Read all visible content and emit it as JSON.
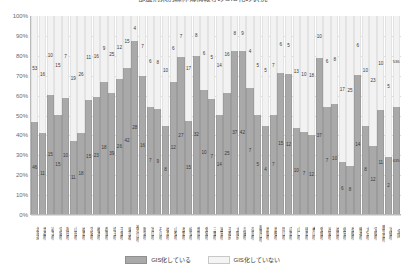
{
  "chart": {
    "title": "都道府県別森林簿情報等のGIS化の状況",
    "legend": {
      "position": "bottom",
      "items": [
        {
          "key": "yes",
          "label": "GIS化している",
          "color": "#a9a9a9"
        },
        {
          "key": "no",
          "label": "GIS化していない",
          "color": "#f4f4f4"
        }
      ]
    },
    "yticks": [
      "100%",
      "90%",
      "80%",
      "70%",
      "60%",
      "50%",
      "40%",
      "30%",
      "20%",
      "10%",
      "0%"
    ]
  },
  "chart_data": {
    "type": "bar",
    "stacked": true,
    "normalized": true,
    "title": "都道府県別森林簿情報等のGIS化の状況",
    "xlabel": "",
    "ylabel": "",
    "ylim": [
      0,
      100
    ],
    "grid": true,
    "legend_position": "bottom",
    "categories": [
      "北海道",
      "青森県",
      "岩手県",
      "宮城県",
      "秋田県",
      "山形県",
      "福島県",
      "茨城県",
      "栃木県",
      "群馬県",
      "埼玉県",
      "千葉県",
      "東京都",
      "神奈川県",
      "新潟県",
      "富山県",
      "石川県",
      "福井県",
      "山梨県",
      "長野県",
      "岐阜県",
      "静岡県",
      "愛知県",
      "三重県",
      "滋賀県",
      "京都府",
      "大阪府",
      "兵庫県",
      "奈良県",
      "和歌山県",
      "鳥取県",
      "島根県",
      "岡山県",
      "広島県",
      "山口県",
      "徳島県",
      "香川県",
      "愛媛県",
      "高知県",
      "福岡県",
      "佐賀県",
      "長崎県",
      "熊本県",
      "大分県",
      "宮崎県",
      "鹿児島県",
      "沖縄県",
      "全国"
    ],
    "series": [
      {
        "name": "GIS化している",
        "color": "#a9a9a9",
        "values": [
          46,
          11,
          15,
          15,
          10,
          11,
          18,
          15,
          23,
          18,
          39,
          26,
          42,
          28,
          16,
          7,
          9,
          8,
          12,
          27,
          15,
          32,
          10,
          7,
          14,
          25,
          37,
          42,
          7,
          5,
          4,
          7,
          15,
          12,
          10,
          7,
          12,
          37,
          7,
          10,
          6,
          8,
          14,
          8,
          12,
          11,
          2,
          635
        ]
      },
      {
        "name": "GIS化していない",
        "color": "#f4f4f4",
        "values": [
          53,
          16,
          10,
          15,
          7,
          19,
          26,
          11,
          16,
          9,
          25,
          12,
          15,
          4,
          7,
          6,
          8,
          10,
          6,
          7,
          17,
          8,
          6,
          5,
          14,
          16,
          8,
          9,
          4,
          5,
          5,
          7,
          6,
          5,
          13,
          10,
          18,
          10,
          6,
          8,
          17,
          25,
          6,
          10,
          23,
          10,
          5,
          536
        ]
      }
    ]
  }
}
